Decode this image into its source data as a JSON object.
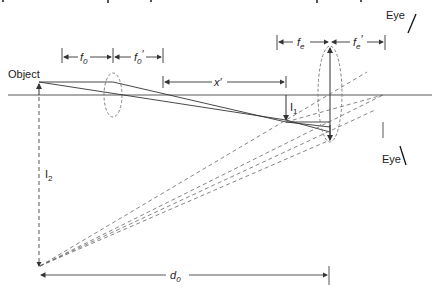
{
  "diagram": {
    "type": "optics-ray-diagram",
    "labels": {
      "object": "Object",
      "eye_top": "Eye",
      "eye_bottom": "Eye",
      "f0": "f",
      "f0_sub": "0",
      "f0p": "f",
      "f0p_sub": "0",
      "f0p_prime": "′",
      "xp": "x′",
      "fe": "f",
      "fe_sub": "e",
      "fep": "f",
      "fep_sub": "e",
      "fep_prime": "′",
      "I1": "I",
      "I1_sub": "1",
      "I2": "I",
      "I2_sub": "2",
      "d0": "d",
      "d0_sub": "0"
    },
    "colors": {
      "line": "#333333",
      "dashed": "#666666",
      "background": "#ffffff"
    }
  }
}
